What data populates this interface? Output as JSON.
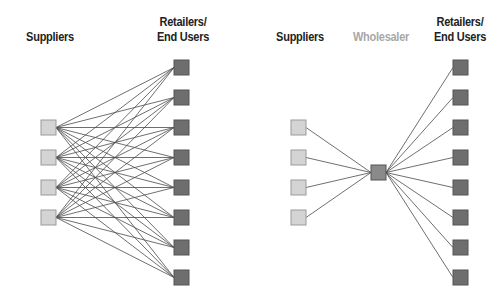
{
  "diagrams": [
    {
      "name": "direct",
      "labels": {
        "suppliers": "Suppliers",
        "retailers_line1": "Retailers/",
        "retailers_line2": "End Users"
      },
      "suppliers_count": 4,
      "retailers_count": 8
    },
    {
      "name": "via-wholesaler",
      "labels": {
        "suppliers": "Suppliers",
        "wholesaler": "Wholesaler",
        "retailers_line1": "Retailers/",
        "retailers_line2": "End Users"
      },
      "suppliers_count": 4,
      "wholesaler_count": 1,
      "retailers_count": 8
    }
  ],
  "colors": {
    "supplier_fill": "#d4d4d4",
    "supplier_stroke": "#9a9a9a",
    "retailer_fill": "#6e6e6e",
    "retailer_stroke": "#555555",
    "wholesaler_fill": "#8a8a8a",
    "line": "#4a4a4a",
    "label": "#222222",
    "label_muted": "#a8a8a8"
  }
}
